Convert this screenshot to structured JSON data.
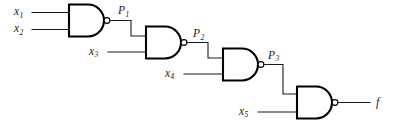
{
  "figure": {
    "type": "logic-circuit-schematic",
    "gate_type": "NAND",
    "gate_count": 4,
    "ink_color": "#1a1a1a",
    "background_color": "#ffffff"
  },
  "inputs": [
    {
      "id": "x1",
      "base": "x",
      "sub": "1",
      "gate": 1,
      "pin": "top"
    },
    {
      "id": "x2",
      "base": "x",
      "sub": "2",
      "gate": 1,
      "pin": "bottom"
    },
    {
      "id": "x3",
      "base": "x",
      "sub": "3",
      "gate": 2,
      "pin": "bottom"
    },
    {
      "id": "x4",
      "base": "x",
      "sub": "4",
      "gate": 3,
      "pin": "bottom"
    },
    {
      "id": "x5",
      "base": "x",
      "sub": "5",
      "gate": 4,
      "pin": "bottom"
    }
  ],
  "intermediate_signals": [
    {
      "id": "P1",
      "base": "P",
      "sub": "1",
      "from_gate": 1,
      "to_gate": 2
    },
    {
      "id": "P2",
      "base": "P",
      "sub": "2",
      "from_gate": 2,
      "to_gate": 3
    },
    {
      "id": "P3",
      "base": "P",
      "sub": "3",
      "from_gate": 3,
      "to_gate": 4
    }
  ],
  "output": {
    "id": "f",
    "base": "f",
    "sub": "",
    "from_gate": 4
  },
  "gates": [
    {
      "index": 1,
      "type": "NAND",
      "inputs": [
        "x1",
        "x2"
      ],
      "output": "P1"
    },
    {
      "index": 2,
      "type": "NAND",
      "inputs": [
        "P1",
        "x3"
      ],
      "output": "P2"
    },
    {
      "index": 3,
      "type": "NAND",
      "inputs": [
        "P2",
        "x4"
      ],
      "output": "P3"
    },
    {
      "index": 4,
      "type": "NAND",
      "inputs": [
        "P3",
        "x5"
      ],
      "output": "f"
    }
  ]
}
